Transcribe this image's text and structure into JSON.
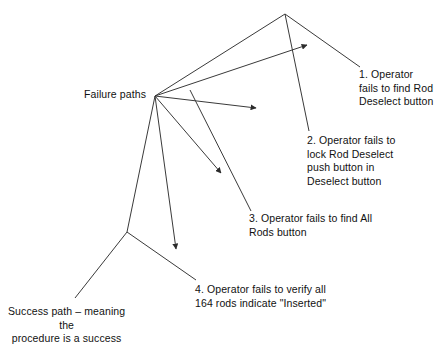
{
  "diagram": {
    "type": "event-tree-fault-path-diagram",
    "background_color": "#ffffff",
    "line_color": "#3a3a3a",
    "text_color": "#111111",
    "hub_label": {
      "text": "Failure paths",
      "x": 84,
      "y": 88
    },
    "success_label": {
      "text": "Success path – meaning\nthe\nprocedure is a success",
      "x": 8,
      "y": 305
    },
    "failure_items": [
      {
        "id": 1,
        "text": "1. Operator\nfails to find Rod\nDeselect button",
        "x": 359,
        "y": 68
      },
      {
        "id": 2,
        "text": "2. Operator fails to\nlock Rod Deselect\npush button in\nDeselect button",
        "x": 307,
        "y": 134
      },
      {
        "id": 3,
        "text": "3. Operator fails to find All\nRods button",
        "x": 249,
        "y": 212
      },
      {
        "id": 4,
        "text": "4. Operator fails to verify all\n164 rods indicate \"Inserted\"",
        "x": 195,
        "y": 283
      }
    ],
    "nodes": {
      "hub": {
        "x": 155,
        "y": 96
      },
      "apex": {
        "x": 285,
        "y": 14
      },
      "success_vertex": {
        "x": 127,
        "y": 232
      }
    },
    "edges": [
      {
        "name": "hub-to-apex",
        "from": [
          155,
          96
        ],
        "to": [
          285,
          14
        ],
        "arrow": false
      },
      {
        "name": "hub-to-arrow-1",
        "from": [
          155,
          96
        ],
        "to": [
          307,
          45
        ],
        "arrow": true
      },
      {
        "name": "hub-to-arrow-2",
        "from": [
          155,
          96
        ],
        "to": [
          256,
          108
        ],
        "arrow": true
      },
      {
        "name": "hub-to-arrow-3",
        "from": [
          155,
          96
        ],
        "to": [
          221,
          173
        ],
        "arrow": true
      },
      {
        "name": "hub-to-arrow-4",
        "from": [
          155,
          96
        ],
        "to": [
          176,
          249
        ],
        "arrow": true
      },
      {
        "name": "apex-to-item1",
        "from": [
          285,
          14
        ],
        "to": [
          360,
          67
        ],
        "arrow": false
      },
      {
        "name": "apex-to-item2",
        "from": [
          285,
          14
        ],
        "to": [
          309,
          131
        ],
        "arrow": false
      },
      {
        "name": "hub-to-success-vertex",
        "from": [
          155,
          96
        ],
        "to": [
          127,
          232
        ],
        "arrow": false
      },
      {
        "name": "success-vertex-to-item4",
        "from": [
          127,
          232
        ],
        "to": [
          196,
          280
        ],
        "arrow": false
      },
      {
        "name": "success-vertex-to-success-label",
        "from": [
          127,
          232
        ],
        "to": [
          75,
          298
        ],
        "arrow": false
      },
      {
        "name": "apex-down-to-item3",
        "from": [
          190,
          90
        ],
        "to": [
          251,
          211
        ],
        "arrow": false
      }
    ]
  }
}
